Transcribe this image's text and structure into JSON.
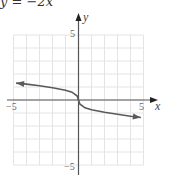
{
  "title": "y = −2x",
  "chart_data": {
    "type": "line",
    "title": "y = −2x",
    "xlabel": "x",
    "ylabel": "y",
    "xlim": [
      -5,
      5
    ],
    "ylim": [
      -5,
      5
    ],
    "grid": true,
    "tick_labels": {
      "x": [
        "−5",
        "5"
      ],
      "y": [
        "5",
        "−5"
      ]
    },
    "series": [
      {
        "name": "curve",
        "x": [
          -4.8,
          -4,
          -3,
          -2,
          -1,
          -0.5,
          -0.1,
          0,
          0.1,
          0.5,
          1,
          2,
          3,
          4,
          4.8
        ],
        "y": [
          1.3,
          1.22,
          1.1,
          0.95,
          0.75,
          0.6,
          0.3,
          0,
          -0.3,
          -0.6,
          -0.75,
          -0.95,
          -1.1,
          -1.25,
          -1.35
        ]
      }
    ],
    "colors": {
      "curve": "#5a5a5a",
      "axis": "#444444",
      "grid": "#e4e4e4"
    }
  }
}
